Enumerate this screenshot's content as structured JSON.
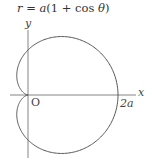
{
  "chart_data": {
    "type": "line",
    "title": "r = a(1 + cos θ)",
    "title_parts": {
      "r": "r",
      "eq": " = ",
      "a": "a",
      "rest": "(1 + cos ",
      "theta": "θ",
      "close": ")"
    },
    "xlabel": "x",
    "ylabel": "y",
    "origin_label": "O",
    "annotations": [
      {
        "text": "2a",
        "x": "2a",
        "y": 0
      }
    ],
    "curve": "cardioid r = a(1 + cos θ), θ ∈ [0, 2π]",
    "key_points": [
      {
        "label": "O",
        "x": 0,
        "y": 0
      },
      {
        "label": "2a",
        "x": 2,
        "y": 0
      }
    ],
    "grid": false,
    "legend": null,
    "colors": {
      "curve": "#555555",
      "axes": "#666666"
    }
  }
}
